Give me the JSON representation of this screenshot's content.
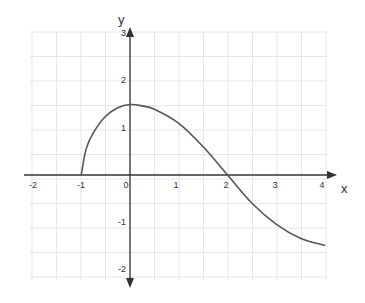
{
  "chart_data": {
    "type": "line",
    "title": "",
    "xlabel": "x",
    "ylabel": "y",
    "xlim": [
      -2,
      4
    ],
    "ylim": [
      -2,
      3
    ],
    "grid": true,
    "grid_step": 0.5,
    "x_ticks": [
      "-2",
      "-1",
      "0",
      "1",
      "2",
      "3",
      "4"
    ],
    "y_ticks": [
      "3",
      "2",
      "1",
      "-1",
      "-2"
    ],
    "series": [
      {
        "name": "f(x)",
        "x": [
          -1,
          -0.9,
          -0.75,
          -0.5,
          -0.25,
          0,
          0.25,
          0.5,
          1,
          1.5,
          2,
          2.5,
          3,
          3.5,
          4
        ],
        "y": [
          0,
          0.55,
          0.9,
          1.25,
          1.43,
          1.5,
          1.47,
          1.4,
          1.1,
          0.6,
          0,
          -0.6,
          -1.05,
          -1.35,
          -1.5
        ]
      }
    ]
  },
  "labels": {
    "x_axis": "x",
    "y_axis": "y",
    "x_ticks": [
      {
        "text": "-2",
        "px": 33
      },
      {
        "text": "-1",
        "px": 81
      },
      {
        "text": "0",
        "px": 126
      },
      {
        "text": "1",
        "px": 176
      },
      {
        "text": "2",
        "px": 226
      },
      {
        "text": "3",
        "px": 275
      },
      {
        "text": "4",
        "px": 322
      }
    ],
    "y_ticks": [
      {
        "text": "3",
        "py": 36
      },
      {
        "text": "2",
        "py": 83
      },
      {
        "text": "1",
        "py": 131
      },
      {
        "text": "-1",
        "py": 225
      },
      {
        "text": "-2",
        "py": 272
      }
    ]
  }
}
